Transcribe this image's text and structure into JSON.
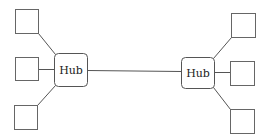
{
  "diagram": {
    "hubs": [
      {
        "id": "hub-left",
        "label": "Hub",
        "x": 54,
        "y": 53,
        "w": 33,
        "h": 33
      },
      {
        "id": "hub-right",
        "label": "Hub",
        "x": 181,
        "y": 57,
        "w": 33,
        "h": 31
      }
    ],
    "nodes": [
      {
        "id": "left-top",
        "x": 15,
        "y": 9,
        "w": 23,
        "h": 24
      },
      {
        "id": "left-middle",
        "x": 15,
        "y": 57,
        "w": 23,
        "h": 23
      },
      {
        "id": "left-bottom",
        "x": 14,
        "y": 105,
        "w": 23,
        "h": 24
      },
      {
        "id": "right-top",
        "x": 231,
        "y": 13,
        "w": 24,
        "h": 24
      },
      {
        "id": "right-middle",
        "x": 230,
        "y": 61,
        "w": 24,
        "h": 24
      },
      {
        "id": "right-bottom",
        "x": 230,
        "y": 109,
        "w": 24,
        "h": 24
      }
    ],
    "edges": [
      {
        "from": "hub-left",
        "to": "hub-right",
        "x1": 87,
        "y1": 70,
        "x2": 181,
        "y2": 71
      },
      {
        "from": "left-top",
        "to": "hub-left",
        "x1": 38,
        "y1": 33,
        "x2": 55,
        "y2": 54
      },
      {
        "from": "left-middle",
        "to": "hub-left",
        "x1": 38,
        "y1": 69,
        "x2": 54,
        "y2": 69
      },
      {
        "from": "left-bottom",
        "to": "hub-left",
        "x1": 37,
        "y1": 105,
        "x2": 55,
        "y2": 85
      },
      {
        "from": "hub-right",
        "to": "right-top",
        "x1": 213,
        "y1": 58,
        "x2": 231,
        "y2": 37
      },
      {
        "from": "hub-right",
        "to": "right-middle",
        "x1": 214,
        "y1": 72,
        "x2": 230,
        "y2": 72
      },
      {
        "from": "hub-right",
        "to": "right-bottom",
        "x1": 213,
        "y1": 87,
        "x2": 230,
        "y2": 109
      }
    ]
  }
}
